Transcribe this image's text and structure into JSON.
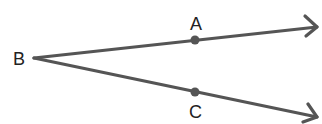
{
  "diagram": {
    "vertex": {
      "name": "B",
      "label": "B"
    },
    "points": [
      {
        "name": "A",
        "label": "A",
        "on_ray": "BA"
      },
      {
        "name": "C",
        "label": "C",
        "on_ray": "BC"
      }
    ],
    "rays": [
      {
        "name": "BA",
        "from": "B",
        "through": "A"
      },
      {
        "name": "BC",
        "from": "B",
        "through": "C"
      }
    ],
    "colors": {
      "line": "#555555",
      "text": "#222222",
      "background": "#ffffff"
    }
  }
}
